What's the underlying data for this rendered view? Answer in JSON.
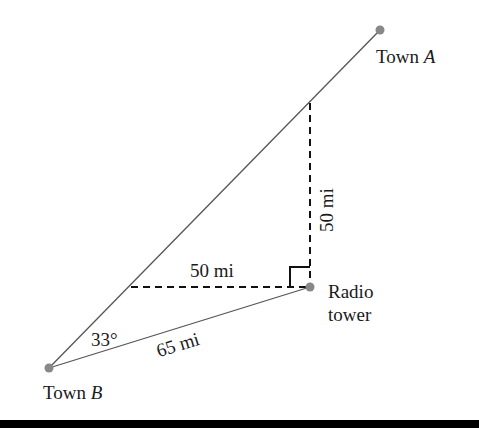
{
  "diagram": {
    "colors": {
      "line": "#555555",
      "dot": "#888888",
      "text": "#1a1a1a",
      "bar": "#000000"
    },
    "points": {
      "town_a": {
        "name": "Town",
        "letter": "A",
        "x": 380,
        "y": 30
      },
      "town_b": {
        "name": "Town",
        "letter": "B",
        "x": 49,
        "y": 368
      },
      "radio_tower": {
        "line1": "Radio",
        "line2": "tower",
        "x": 310,
        "y": 287
      }
    },
    "labels": {
      "angle": "33°",
      "b_to_tower": "65 mi",
      "horizontal": "50 mi",
      "vertical": "50 mi"
    }
  }
}
